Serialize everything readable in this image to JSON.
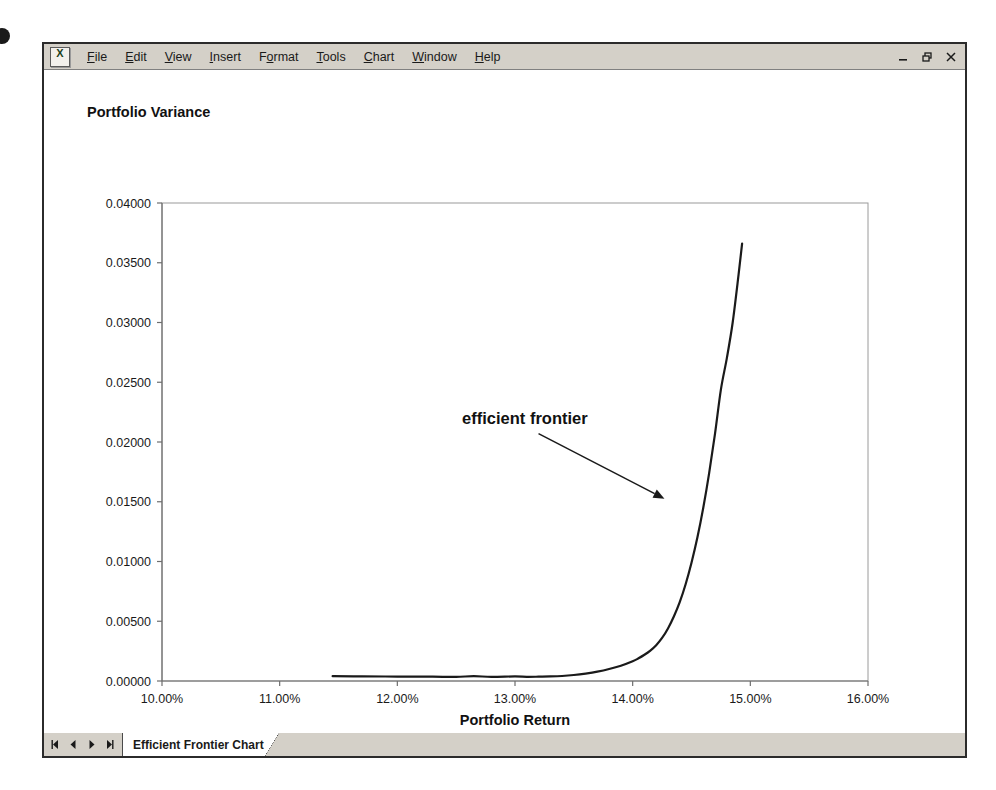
{
  "window": {
    "app_icon": "excel-icon",
    "menus": [
      {
        "label": "File",
        "accel": "F"
      },
      {
        "label": "Edit",
        "accel": "E"
      },
      {
        "label": "View",
        "accel": "V"
      },
      {
        "label": "Insert",
        "accel": "I"
      },
      {
        "label": "Format",
        "accel": "o"
      },
      {
        "label": "Tools",
        "accel": "T"
      },
      {
        "label": "Chart",
        "accel": "C"
      },
      {
        "label": "Window",
        "accel": "W"
      },
      {
        "label": "Help",
        "accel": "H"
      }
    ],
    "controls": {
      "minimize": "minimize-icon",
      "restore": "restore-icon",
      "close": "close-icon"
    }
  },
  "sheet_tabs": {
    "nav": {
      "first": "first-sheet-icon",
      "prev": "previous-sheet-icon",
      "next": "next-sheet-icon",
      "last": "last-sheet-icon"
    },
    "active_tab": "Efficient Frontier Chart"
  },
  "chart_data": {
    "type": "line",
    "title": "",
    "xlabel": "Portfolio Return",
    "ylabel": "Portfolio Variance",
    "xlim": [
      0.1,
      0.16
    ],
    "ylim": [
      0.0,
      0.04
    ],
    "grid": false,
    "legend": null,
    "x_tick_labels": [
      "10.00%",
      "11.00%",
      "12.00%",
      "13.00%",
      "14.00%",
      "15.00%",
      "16.00%"
    ],
    "x_tick_values": [
      0.1,
      0.11,
      0.12,
      0.13,
      0.14,
      0.15,
      0.16
    ],
    "y_tick_labels": [
      "0.00000",
      "0.00500",
      "0.01000",
      "0.01500",
      "0.02000",
      "0.02500",
      "0.03000",
      "0.03500",
      "0.04000"
    ],
    "y_tick_values": [
      0.0,
      0.005,
      0.01,
      0.015,
      0.02,
      0.025,
      0.03,
      0.035,
      0.04
    ],
    "series": [
      {
        "name": "efficient frontier",
        "color": "#1a1a1a",
        "x": [
          0.1145,
          0.117,
          0.12,
          0.123,
          0.125,
          0.1265,
          0.128,
          0.13,
          0.131,
          0.132,
          0.133,
          0.134,
          0.135,
          0.136,
          0.137,
          0.138,
          0.139,
          0.14,
          0.1405,
          0.141,
          0.1415,
          0.142,
          0.1425,
          0.143,
          0.1435,
          0.144,
          0.1445,
          0.145,
          0.1455,
          0.146,
          0.1465,
          0.147,
          0.1475,
          0.148,
          0.1485,
          0.149,
          0.1493
        ],
        "y": [
          0.0004,
          0.00039,
          0.00037,
          0.00036,
          0.00035,
          0.0004,
          0.00035,
          0.00038,
          0.00035,
          0.00036,
          0.00038,
          0.00042,
          0.0005,
          0.00062,
          0.00078,
          0.001,
          0.00128,
          0.00165,
          0.0019,
          0.0022,
          0.00255,
          0.003,
          0.0036,
          0.0044,
          0.0054,
          0.0066,
          0.0081,
          0.0099,
          0.012,
          0.0145,
          0.0174,
          0.0207,
          0.0244,
          0.027,
          0.03,
          0.034,
          0.0366
        ]
      }
    ],
    "annotations": [
      {
        "name": "efficient-frontier-label",
        "text": "efficient frontier",
        "text_x": 0.1255,
        "text_y": 0.0215,
        "arrow_from_x": 0.132,
        "arrow_from_y": 0.0207,
        "arrow_to_x": 0.1427,
        "arrow_to_y": 0.01525
      }
    ]
  }
}
